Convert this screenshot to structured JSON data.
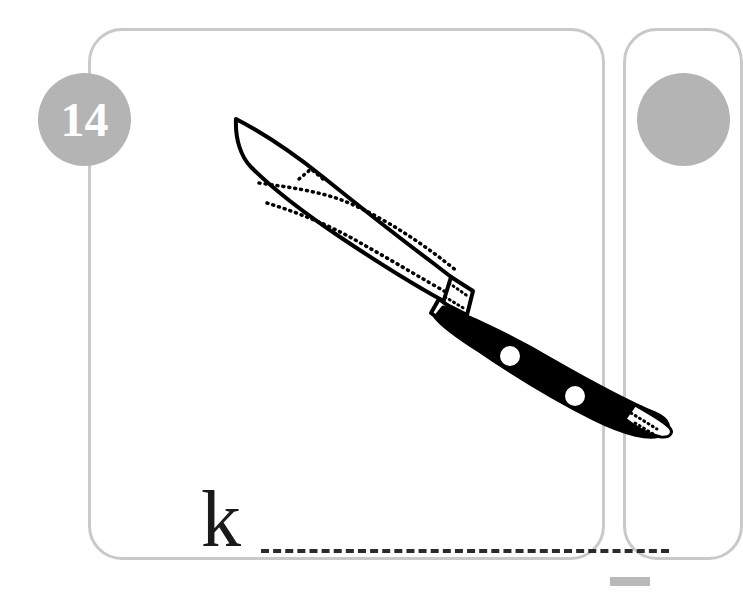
{
  "page": {
    "type": "vocabulary-flashcard-worksheet",
    "background_color": "#ffffff"
  },
  "card": {
    "border_color": "#c9c9c9",
    "background_color": "#ffffff",
    "badge": {
      "number": "14",
      "fill_color": "#b4b4b4",
      "text_color": "#ffffff"
    },
    "illustration": {
      "name": "knife-illustration",
      "subject": "knife",
      "style": "black-and-white-line-drawing",
      "blade_fill": "#ffffff",
      "blade_outline_color": "#000000",
      "handle_fill": "#000000",
      "rivet_fill": "#ffffff"
    },
    "answer": {
      "letter": "k",
      "letter_color": "#1a1a1a",
      "line_style": "dashed",
      "line_color": "#2b2b2b"
    }
  },
  "next_card": {
    "border_color": "#c9c9c9",
    "badge_fill_color": "#b4b4b4"
  },
  "corner_bar": {
    "color": "#b9b9b9"
  }
}
